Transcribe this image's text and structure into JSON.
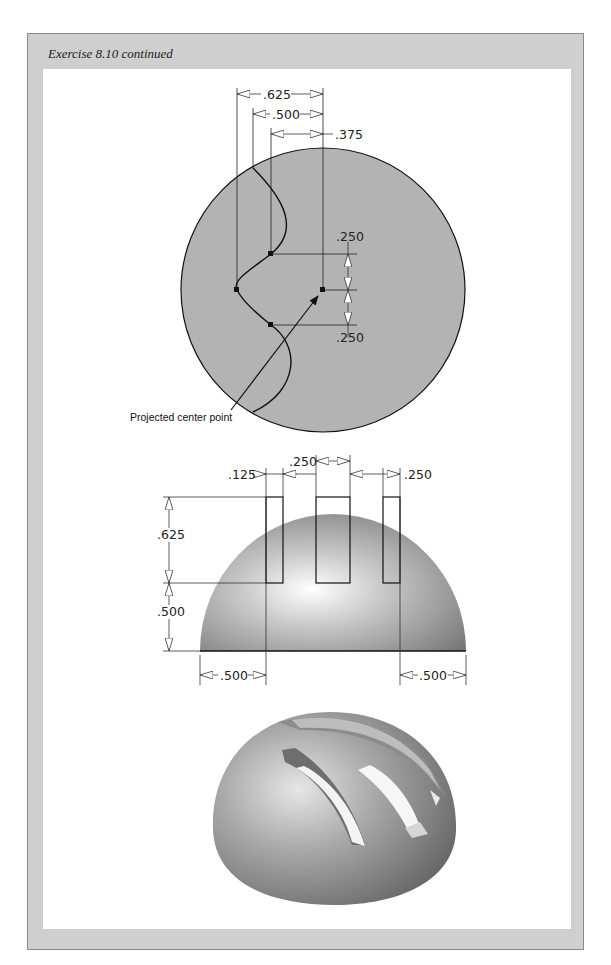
{
  "page_header": "page header text (faint)",
  "panel": {
    "title": "Exercise 8.10 continued"
  },
  "figure1": {
    "name": "Top view sketch",
    "dimensions": {
      "d1": ".625",
      "d2": ".500",
      "d3": ".375",
      "d4": ".250",
      "d5": ".250"
    },
    "callout": "Projected center point"
  },
  "figure2": {
    "name": "Front view hemisphere with slots",
    "dimensions": {
      "slot_width_left": ".125",
      "slot_gap_center": ".250",
      "slot_width_right": ".250",
      "slot_height": ".625",
      "base_height": ".500",
      "left_offset": ".500",
      "right_offset": ".500"
    }
  },
  "figure3": {
    "name": "Shaded isometric result"
  },
  "colors": {
    "panel_gray": "#cfcfcf",
    "sketch_fill": "#b3b3b3",
    "line": "#111111"
  }
}
